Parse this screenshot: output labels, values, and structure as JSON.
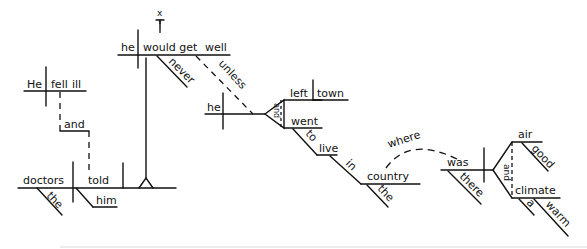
{
  "diagram": {
    "type": "Reed-Kellogg sentence diagram",
    "clause1": {
      "subject": "He",
      "verb": "fell",
      "complement": "ill"
    },
    "conjunction": "and",
    "clause2": {
      "subject": "doctors",
      "subject_modifier": "the",
      "verb": "told",
      "indirect_object": "him",
      "object_clause": {
        "expletive": "x",
        "subject": "he",
        "verb": "would get",
        "complement": "well",
        "modifier": "never",
        "subordinator": "unless",
        "sub_clause": {
          "subject": "he",
          "conjunction": "and",
          "verb1": "left",
          "object1": "town",
          "verb2": "went",
          "infinitive_marker": "to",
          "infinitive": "live",
          "preposition": "in",
          "prep_object": "country",
          "prep_object_modifier": "the",
          "relative_adverb": "where",
          "relative_clause": {
            "verb": "was",
            "verb_modifier": "there",
            "conjunction": "and",
            "subject1": "air",
            "subject1_modifier": "good",
            "subject2": "climate",
            "subject2_modifier1": "a",
            "subject2_modifier2": "warm"
          }
        }
      }
    }
  }
}
